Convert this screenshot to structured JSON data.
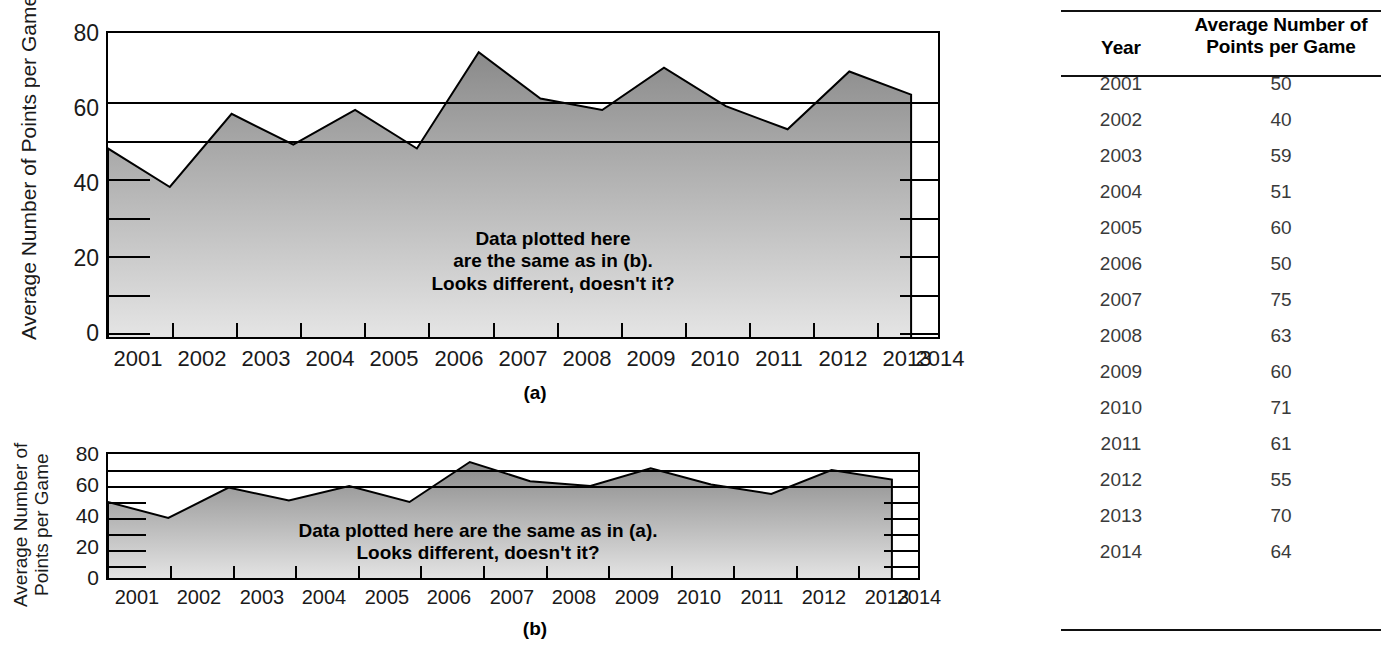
{
  "chart_data": [
    {
      "type": "area",
      "id": "chart-a",
      "caption": "(a)",
      "title": "",
      "ylabel": "Average Number of Points per Game",
      "ylabel_lines": [
        "Average Number of Points per Game"
      ],
      "xlabel": "",
      "categories": [
        "2001",
        "2002",
        "2003",
        "2004",
        "2005",
        "2006",
        "2007",
        "2008",
        "2009",
        "2010",
        "2011",
        "2012",
        "2013",
        "2014"
      ],
      "values": [
        50,
        40,
        59,
        51,
        60,
        50,
        75,
        63,
        60,
        71,
        61,
        55,
        70,
        64
      ],
      "ylim": [
        0,
        80
      ],
      "ytick_labels": [
        "0",
        "20",
        "40",
        "60",
        "80"
      ],
      "ytick_values": [
        0,
        20,
        40,
        60,
        80
      ],
      "minor_tick_values": [
        10,
        30,
        50,
        70
      ],
      "gridline_values": [
        60,
        70
      ],
      "grid": true,
      "legend": "none",
      "annotation": "Data plotted here\nare the same as in (b).\nLooks different, doesn't it?",
      "annotation_lines": [
        "Data plotted here",
        "are the same as in (b).",
        "Looks different, doesn't it?"
      ]
    },
    {
      "type": "area",
      "id": "chart-b",
      "caption": "(b)",
      "title": "",
      "ylabel": "Average Number of Points per Game",
      "ylabel_lines": [
        "Average Number of",
        "Points per Game"
      ],
      "xlabel": "",
      "categories": [
        "2001",
        "2002",
        "2003",
        "2004",
        "2005",
        "2006",
        "2007",
        "2008",
        "2009",
        "2010",
        "2011",
        "2012",
        "2013",
        "2014"
      ],
      "values": [
        50,
        40,
        59,
        51,
        60,
        50,
        75,
        63,
        60,
        71,
        61,
        55,
        70,
        64
      ],
      "ylim": [
        0,
        80
      ],
      "ytick_labels": [
        "0",
        "20",
        "40",
        "60",
        "80"
      ],
      "ytick_values": [
        0,
        20,
        40,
        60,
        80
      ],
      "minor_tick_values": [
        10,
        30,
        50,
        70
      ],
      "gridline_values": [
        60,
        70
      ],
      "grid": true,
      "legend": "none",
      "annotation": "Data plotted here are the same as in (a).\nLooks different, doesn't it?",
      "annotation_lines": [
        "Data plotted here are the same as in (a).",
        "Looks different, doesn't it?"
      ]
    }
  ],
  "table": {
    "headers": {
      "year": "Year",
      "value_line1": "Average Number of",
      "value_line2": "Points per Game"
    },
    "rows": [
      {
        "year": "2001",
        "value": "50"
      },
      {
        "year": "2002",
        "value": "40"
      },
      {
        "year": "2003",
        "value": "59"
      },
      {
        "year": "2004",
        "value": "51"
      },
      {
        "year": "2005",
        "value": "60"
      },
      {
        "year": "2006",
        "value": "50"
      },
      {
        "year": "2007",
        "value": "75"
      },
      {
        "year": "2008",
        "value": "63"
      },
      {
        "year": "2009",
        "value": "60"
      },
      {
        "year": "2010",
        "value": "71"
      },
      {
        "year": "2011",
        "value": "61"
      },
      {
        "year": "2012",
        "value": "55"
      },
      {
        "year": "2013",
        "value": "70"
      },
      {
        "year": "2014",
        "value": "64"
      }
    ]
  },
  "colors": {
    "area_top": "#8a8a8a",
    "area_bottom": "#e2e2e2",
    "axis": "#000000",
    "text": "#1a1a1a",
    "table_value_text": "#3a3a3a",
    "background": "#ffffff"
  }
}
